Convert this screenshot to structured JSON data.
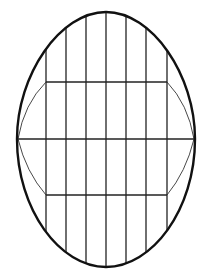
{
  "diagram": {
    "title": "",
    "colors": {
      "stroke": "#111111",
      "background": "#ffffff"
    },
    "egg": {
      "cx": 106,
      "top": 12,
      "bottom": 267,
      "widest_y": 139,
      "left": 17,
      "right": 195
    },
    "vertical_lines_x": [
      46,
      66,
      86,
      106,
      126,
      146,
      167
    ],
    "horizontal_lines_y": [
      82,
      139,
      195
    ],
    "inner_curves": [
      {
        "from": [
          46,
          82
        ],
        "to": [
          17,
          139
        ],
        "side": "left-upper"
      },
      {
        "from": [
          167,
          82
        ],
        "to": [
          195,
          139
        ],
        "side": "right-upper"
      },
      {
        "from": [
          17,
          139
        ],
        "to": [
          46,
          195
        ],
        "side": "left-lower"
      },
      {
        "from": [
          195,
          139
        ],
        "to": [
          167,
          195
        ],
        "side": "right-lower"
      }
    ]
  }
}
